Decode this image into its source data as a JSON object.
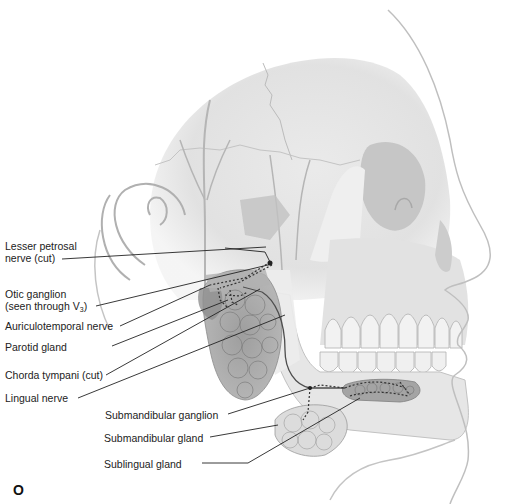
{
  "figure": {
    "panel_letter": "O",
    "colors": {
      "bone": "#e4e4e4",
      "bone_shadow": "#c9c9c9",
      "gland": "#a8a8a8",
      "gland_dark": "#8e8e8e",
      "outline": "#b8b8b8",
      "nerve": "#5a5a5a",
      "leader": "#222222",
      "text": "#222222"
    }
  },
  "labels": [
    {
      "id": "lesser-petrosal",
      "line1": "Lesser petrosal",
      "line2": "nerve (cut)"
    },
    {
      "id": "otic-ganglion",
      "line1": "Otic ganglion",
      "line2_pre": "(seen through V",
      "line2_sub": "3",
      "line2_post": ")"
    },
    {
      "id": "auriculotemporal",
      "text": "Auriculotemporal nerve"
    },
    {
      "id": "parotid",
      "text": "Parotid gland"
    },
    {
      "id": "chorda-tympani",
      "text": "Chorda tympani (cut)"
    },
    {
      "id": "lingual",
      "text": "Lingual nerve"
    },
    {
      "id": "submandibular-ganglion",
      "text": "Submandibular ganglion"
    },
    {
      "id": "submandibular-gland",
      "text": "Submandibular gland"
    },
    {
      "id": "sublingual-gland",
      "text": "Sublingual gland"
    }
  ]
}
